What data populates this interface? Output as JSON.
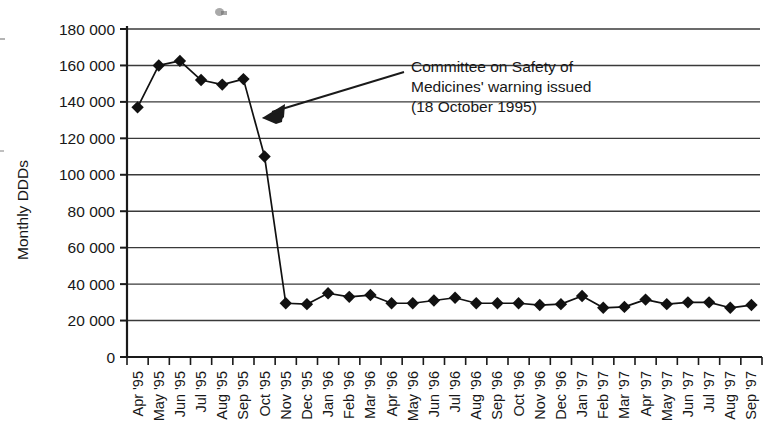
{
  "chart_data": {
    "type": "line",
    "title": "",
    "xlabel": "",
    "ylabel": "Monthly DDDs",
    "ylim": [
      0,
      180000
    ],
    "ytick_step": 20000,
    "ytick_labels": [
      "0",
      "20 000",
      "40 000",
      "60 000",
      "80 000",
      "100 000",
      "120 000",
      "140 000",
      "160 000",
      "180 000"
    ],
    "ytick_values": [
      0,
      20000,
      40000,
      60000,
      80000,
      100000,
      120000,
      140000,
      160000,
      180000
    ],
    "grid": "horizontal",
    "legend": "none",
    "marker": "filled-diamond",
    "line_color": "#111111",
    "marker_color": "#111111",
    "categories": [
      "Apr '95",
      "May '95",
      "Jun '95",
      "Jul '95",
      "Aug '95",
      "Sep '95",
      "Oct '95",
      "Nov '95",
      "Dec '95",
      "Jan '96",
      "Feb '96",
      "Mar '96",
      "Apr '96",
      "May '96",
      "Jun '96",
      "Jul '96",
      "Aug '96",
      "Sep '96",
      "Oct '96",
      "Nov '96",
      "Dec '96",
      "Jan '97",
      "Feb '97",
      "Mar '97",
      "Apr '97",
      "May '97",
      "Jun '97",
      "Jul '97",
      "Aug '97",
      "Sep '97"
    ],
    "values": [
      137000,
      160000,
      162500,
      152000,
      149500,
      152500,
      110000,
      29500,
      29000,
      35000,
      33000,
      34000,
      29500,
      29500,
      31000,
      32500,
      29500,
      29500,
      29500,
      28500,
      29000,
      33500,
      27000,
      27500,
      31500,
      29000,
      30000,
      30000,
      27000,
      28500
    ],
    "annotations": [
      {
        "lines": [
          "Committee on Safety of",
          "Medicines' warning issued",
          "(18 October 1995)"
        ],
        "points_to_category": "Oct '95",
        "arrow": "left-pointing"
      }
    ]
  },
  "axis": {
    "y_axis_title": "Monthly DDDs"
  }
}
